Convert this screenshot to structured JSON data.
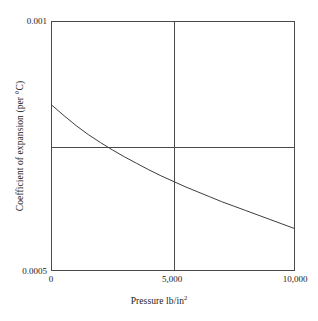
{
  "chart_data": {
    "type": "line",
    "title": "",
    "subtitle": "",
    "xlabel": "Pressure lb/in",
    "xlabel_superscript": "2",
    "ylabel": "Coefficient of expansion (per °C)",
    "xlim": [
      0,
      10000
    ],
    "ylim": [
      0.0005,
      0.001
    ],
    "xticks": [
      0,
      5000,
      10000
    ],
    "xticklabels": [
      "0",
      "5,000",
      "10,000"
    ],
    "yticks": [
      0.0005,
      0.001
    ],
    "yticklabels": [
      "0.0005",
      "0.001"
    ],
    "grid": true,
    "gridlines": {
      "vertical_at_x": [
        5000
      ],
      "horizontal_at_y": [
        0.00075
      ]
    },
    "legend": "none",
    "series": [
      {
        "name": "Coefficient of expansion",
        "color": "#3a3a3a",
        "x": [
          0,
          500,
          1000,
          1500,
          2000,
          2500,
          3000,
          3500,
          4000,
          4500,
          5000,
          5500,
          6000,
          6500,
          7000,
          7500,
          8000,
          8500,
          9000,
          9500,
          10000
        ],
        "y": [
          0.000832,
          0.000811,
          0.000791,
          0.000773,
          0.000757,
          0.000742,
          0.000728,
          0.000715,
          0.000702,
          0.00069,
          0.000679,
          0.000668,
          0.000658,
          0.000648,
          0.000638,
          0.000629,
          0.00062,
          0.000611,
          0.000602,
          0.000593,
          0.000584
        ]
      }
    ],
    "annotations": []
  },
  "axes": {
    "y_top_label": "0.001",
    "y_bottom_label": "0.0005",
    "x_labels": [
      "0",
      "5,000",
      "10,000"
    ],
    "x_title_text": "Pressure lb/in",
    "x_title_sup": "2",
    "y_title_text": "Coefficient of expansion (per °C)"
  },
  "style": {
    "frame_color": "#4a4a4a",
    "curve_color": "#3a3a3a",
    "background": "#ffffff"
  }
}
